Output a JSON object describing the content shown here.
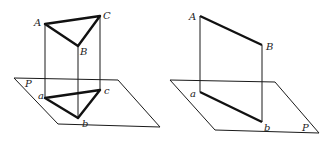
{
  "figures": [
    {
      "id": "prism-projection",
      "plane_label": "P",
      "labels": {
        "A": "A",
        "B": "B",
        "C": "C",
        "a": "a",
        "b": "b",
        "c": "c"
      }
    },
    {
      "id": "segment-projection",
      "plane_label": "P",
      "labels": {
        "A": "A",
        "B": "B",
        "a": "a",
        "b": "b"
      }
    }
  ]
}
